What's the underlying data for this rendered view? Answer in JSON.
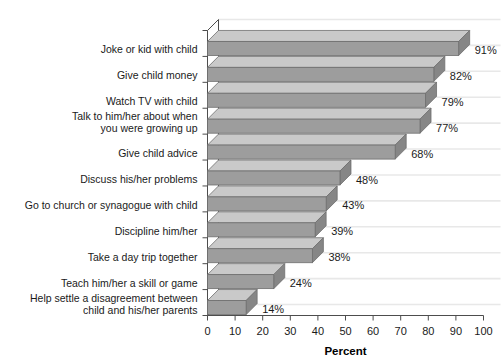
{
  "chart_data": {
    "type": "bar",
    "orientation": "horizontal",
    "style": "3d",
    "title": "",
    "subtitle": "",
    "xlabel": "Percent",
    "ylabel": "",
    "xlim": [
      0,
      100
    ],
    "xticks": [
      0,
      10,
      20,
      30,
      40,
      50,
      60,
      70,
      80,
      90,
      100
    ],
    "xtick_labels": [
      "0",
      "10",
      "20",
      "30",
      "40",
      "50",
      "60",
      "70",
      "80",
      "90",
      "100"
    ],
    "grid": false,
    "legend": null,
    "value_suffix": "%",
    "categories": [
      "Joke or kid with child",
      "Give child money",
      "Watch TV with child",
      "Talk to him/her about when you were growing up",
      "Give child advice",
      "Discuss his/her problems",
      "Go to church or synagogue with child",
      "Discipline him/her",
      "Take a day trip together",
      "Teach him/her a skill or game",
      "Help settle a disagreement between child and his/her parents"
    ],
    "category_lines": [
      [
        "Joke or kid with child"
      ],
      [
        "Give child money"
      ],
      [
        "Watch TV with child"
      ],
      [
        "Talk to him/her about when",
        "you were growing up"
      ],
      [
        "Give child advice"
      ],
      [
        "Discuss his/her problems"
      ],
      [
        "Go to church or synagogue with child"
      ],
      [
        "Discipline him/her"
      ],
      [
        "Take a day trip together"
      ],
      [
        "Teach him/her a skill or game"
      ],
      [
        "Help settle a disagreement between",
        "child and his/her parents"
      ]
    ],
    "values": [
      91,
      82,
      79,
      77,
      68,
      48,
      43,
      39,
      38,
      24,
      14
    ],
    "value_labels": [
      "91%",
      "82%",
      "79%",
      "77%",
      "68%",
      "48%",
      "43%",
      "39%",
      "38%",
      "24%",
      "14%"
    ],
    "colors": {
      "bar_front": "#9d9d9d",
      "bar_top": "#c9c9c9",
      "bar_side": "#868686",
      "bar_outline": "#6e6e6e",
      "axis": "#4d4d4d",
      "wall_line": "#e8e8e8",
      "text": "#1a1a1a",
      "background": "#ffffff"
    }
  }
}
